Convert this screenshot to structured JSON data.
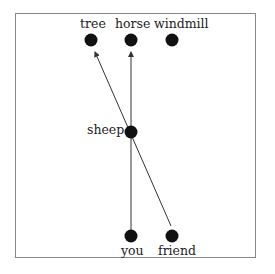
{
  "diagram": {
    "nodes": [
      {
        "id": "tree",
        "label": "tree",
        "x": 91,
        "y": 40
      },
      {
        "id": "horse",
        "label": "horse",
        "x": 131,
        "y": 40
      },
      {
        "id": "windmill",
        "label": "windmill",
        "x": 172,
        "y": 40
      },
      {
        "id": "sheep",
        "label": "sheep",
        "x": 131,
        "y": 132
      },
      {
        "id": "you",
        "label": "you",
        "x": 131,
        "y": 236
      },
      {
        "id": "friend",
        "label": "friend",
        "x": 172,
        "y": 236
      }
    ],
    "edges": [
      {
        "from": "you",
        "to": "horse",
        "arrow": true
      },
      {
        "from": "friend",
        "to": "tree",
        "arrow": true
      }
    ],
    "colors": {
      "node": "#111111",
      "edge": "#333333",
      "frame": "#888888"
    }
  }
}
